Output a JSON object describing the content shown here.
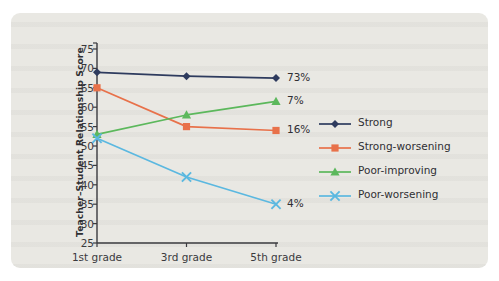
{
  "figure": {
    "background_color": "#e9e8e3",
    "page_color": "#ffffff"
  },
  "chart_data": {
    "type": "line",
    "title": "",
    "xlabel": "",
    "ylabel": "Teacher–Student Relationship Score",
    "categories": [
      "1st grade",
      "3rd grade",
      "5th grade"
    ],
    "x": [
      1,
      3,
      5
    ],
    "ylim": [
      25,
      75
    ],
    "ytick_step": 5,
    "yticks": [
      25,
      30,
      35,
      40,
      45,
      50,
      55,
      60,
      65,
      70,
      75
    ],
    "grid": false,
    "legend_position": "right",
    "series": [
      {
        "name": "Strong",
        "color": "#2e3b5e",
        "marker": "diamond",
        "values": [
          69,
          68,
          67.5
        ],
        "end_label": "73%"
      },
      {
        "name": "Strong-worsening",
        "color": "#e8714a",
        "marker": "square",
        "values": [
          65,
          55,
          54
        ],
        "end_label": "16%"
      },
      {
        "name": "Poor-improving",
        "color": "#5cb85c",
        "marker": "triangle",
        "values": [
          53,
          58,
          61.5
        ],
        "end_label": "7%"
      },
      {
        "name": "Poor-worsening",
        "color": "#5bb8e0",
        "marker": "x",
        "values": [
          52,
          42,
          35
        ],
        "end_label": "4%"
      }
    ]
  }
}
